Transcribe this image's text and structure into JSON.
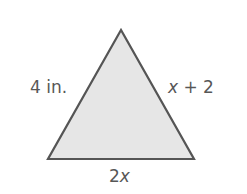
{
  "figure": {
    "shape": "triangle",
    "fill_color": "#e6e6e6",
    "stroke_color": "#555555",
    "text_color": "#575757",
    "vertices": {
      "apex": [
        121,
        30
      ],
      "bottom_left": [
        48,
        159
      ],
      "bottom_right": [
        194,
        159
      ]
    },
    "labels": {
      "left_side": {
        "value": "4",
        "unit": " in."
      },
      "right_side": {
        "var": "x",
        "rest": " + 2"
      },
      "base": {
        "coef": "2",
        "var": "x"
      }
    }
  }
}
